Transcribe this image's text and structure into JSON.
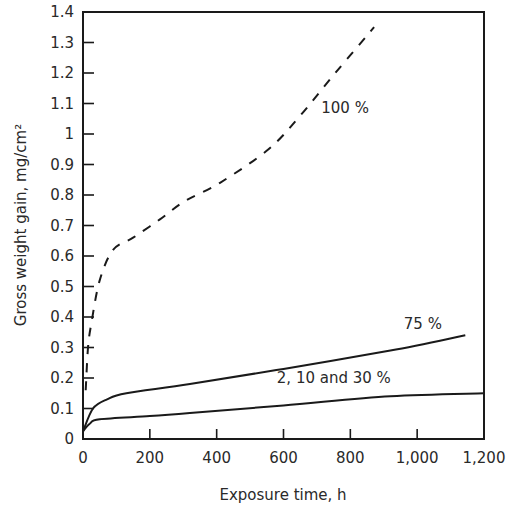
{
  "chart_data": {
    "type": "line",
    "title": "",
    "xlabel": "Exposure time, h",
    "ylabel": "Gross weight gain, mg/cm²",
    "xlim": [
      0,
      1200
    ],
    "ylim": [
      0,
      1.4
    ],
    "grid": false,
    "legend": "none (curves labeled inline)",
    "x_ticks": [
      0,
      200,
      400,
      600,
      800,
      1000,
      1200
    ],
    "x_tick_labels": [
      "0",
      "200",
      "400",
      "600",
      "800",
      "1,000",
      "1,200"
    ],
    "y_ticks": [
      0,
      0.1,
      0.2,
      0.3,
      0.4,
      0.5,
      0.6,
      0.7,
      0.8,
      0.9,
      1.0,
      1.1,
      1.2,
      1.3,
      1.4
    ],
    "y_tick_labels": [
      "0",
      "0.1",
      "0.2",
      "0.3",
      "0.4",
      "0.5",
      "0.6",
      "0.7",
      "0.8",
      "0.9",
      "1",
      "1.1",
      "1.2",
      "1.3",
      "1.4"
    ],
    "series": [
      {
        "name": "100 %",
        "style": "dashed",
        "x": [
          8,
          15,
          25,
          50,
          90,
          150,
          230,
          305,
          410,
          555,
          650,
          755,
          871
        ],
        "y": [
          0.16,
          0.3,
          0.38,
          0.52,
          0.62,
          0.66,
          0.72,
          0.78,
          0.84,
          0.95,
          1.06,
          1.2,
          1.35
        ],
        "label_pos": {
          "x": 713,
          "y": 1.07
        }
      },
      {
        "name": "75 %",
        "style": "solid",
        "x": [
          0,
          30,
          72,
          130,
          320,
          600,
          920,
          1144
        ],
        "y": [
          0.025,
          0.1,
          0.13,
          0.15,
          0.18,
          0.23,
          0.29,
          0.34
        ],
        "label_pos": {
          "x": 960,
          "y": 0.36
        }
      },
      {
        "name": "2, 10 and 30 %",
        "style": "solid",
        "x": [
          0,
          20,
          50,
          200,
          320,
          600,
          920,
          1200
        ],
        "y": [
          0.025,
          0.05,
          0.065,
          0.075,
          0.085,
          0.11,
          0.14,
          0.15
        ],
        "label_pos": {
          "x": 580,
          "y": 0.185
        }
      }
    ]
  }
}
